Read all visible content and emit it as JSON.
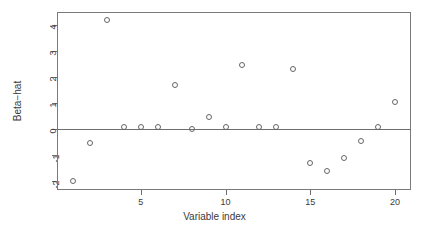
{
  "chart_data": {
    "type": "scatter",
    "title": "",
    "xlabel": "Variable index",
    "ylabel": "Beta-hat",
    "x": [
      1,
      2,
      3,
      4,
      5,
      6,
      7,
      8,
      9,
      10,
      11,
      12,
      13,
      14,
      15,
      16,
      17,
      18,
      19,
      20
    ],
    "values": [
      -2.0,
      -0.55,
      4.2,
      0.08,
      0.08,
      0.07,
      1.7,
      0.0,
      0.45,
      0.07,
      2.45,
      0.07,
      0.07,
      2.3,
      -1.3,
      -1.6,
      -1.1,
      -0.45,
      0.07,
      1.05
    ],
    "series": [
      {
        "name": "Beta-hat",
        "values": [
          -2.0,
          -0.55,
          4.2,
          0.08,
          0.08,
          0.07,
          1.7,
          0.0,
          0.45,
          0.07,
          2.45,
          0.07,
          0.07,
          2.3,
          -1.3,
          -1.6,
          -1.1,
          -0.45,
          0.07,
          1.05
        ]
      }
    ],
    "xlim": [
      0.05,
      20.95
    ],
    "ylim": [
      -2.35,
      4.5
    ],
    "xticks": [
      5,
      10,
      15,
      20
    ],
    "xtick_labels": [
      "5",
      "10",
      "15",
      "20"
    ],
    "yticks": [
      -2,
      -1,
      0,
      1,
      2,
      3,
      4
    ],
    "ytick_labels": [
      "-2",
      "-1",
      "0",
      "1",
      "2",
      "3",
      "4"
    ],
    "grid": false,
    "legend": null,
    "annotations": [
      {
        "name": "zero-reference-line",
        "y": 0
      }
    ],
    "marker": "open-circle",
    "marker_color": "#666666",
    "axis_color": "#6e6e6e",
    "background_color": "#ffffff"
  },
  "axis_labels": {
    "y_title": "Beta−hat",
    "x_title": "Variable index"
  }
}
